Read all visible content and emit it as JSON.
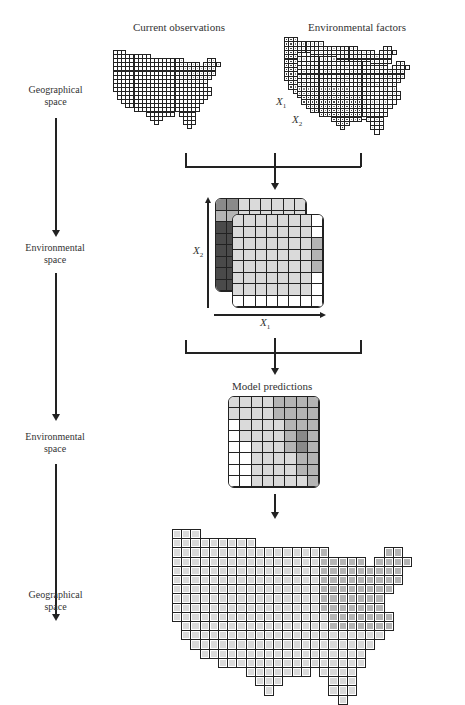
{
  "left_labels": [
    {
      "line1": "Geographical",
      "line2": "space"
    },
    {
      "line1": "Environmental",
      "line2": "space"
    },
    {
      "line1": "Environmental",
      "line2": "space"
    },
    {
      "line1": "Geographical",
      "line2": "space"
    }
  ],
  "titles": {
    "current_observations": "Current observations",
    "environmental_factors": "Environmental factors",
    "model_predictions": "Model predictions"
  },
  "variables": {
    "x1": "X",
    "x1_sub": "1",
    "x2": "X",
    "x2_sub": "2"
  },
  "colors": {
    "line": "#222222",
    "cell_white": "#ffffff",
    "shade_light": "#d9d9d9",
    "shade_mid": "#a8a8a8",
    "shade_dark": "#555555",
    "shade_darkest": "#2a2a2a"
  },
  "us_mask": [
    "111.......................",
    "111111111.................",
    "11111111111111111......11.",
    "111111111111111111111.1111",
    "1111111111111111111111111.",
    "1111111111111111111111111.",
    "111111111111111111111111..",
    "11111111111111111111111...",
    "11111111111111111111111...",
    "111111111111111111111111..",
    ".11111111111111111111111..",
    ".1111111111111111111111...",
    "..11111111111111111111....",
    "...111111111111111111.....",
    ".....1111111111111111.....",
    "........1111111.1111......",
    ".........111.....111......",
    "..........1......111......",
    "..................1......."
  ],
  "observations_shading": "northeast_light",
  "predictions_shading": "northeast_mid",
  "env_space": {
    "back_grid": [
      [
        3,
        3,
        1,
        1,
        1,
        1,
        1,
        1
      ],
      [
        2,
        2,
        1,
        1,
        1,
        1,
        1,
        1
      ],
      [
        4,
        4,
        1,
        1,
        1,
        1,
        1,
        1
      ],
      [
        4,
        4,
        1,
        1,
        1,
        1,
        1,
        1
      ],
      [
        4,
        4,
        1,
        1,
        1,
        1,
        1,
        1
      ],
      [
        4,
        4,
        1,
        1,
        1,
        1,
        1,
        1
      ],
      [
        4,
        4,
        1,
        1,
        1,
        1,
        1,
        1
      ],
      [
        4,
        4,
        1,
        1,
        1,
        1,
        1,
        1
      ]
    ],
    "front_grid": [
      [
        1,
        1,
        1,
        1,
        1,
        1,
        1,
        0
      ],
      [
        1,
        1,
        1,
        1,
        1,
        1,
        1,
        0
      ],
      [
        1,
        1,
        1,
        1,
        1,
        1,
        1,
        2
      ],
      [
        1,
        1,
        1,
        1,
        1,
        1,
        1,
        2
      ],
      [
        1,
        1,
        1,
        1,
        1,
        1,
        1,
        2
      ],
      [
        1,
        1,
        1,
        1,
        1,
        1,
        1,
        0
      ],
      [
        1,
        1,
        1,
        1,
        1,
        1,
        1,
        0
      ],
      [
        0,
        0,
        0,
        0,
        0,
        0,
        0,
        0
      ]
    ]
  },
  "predictions_grid": [
    [
      1,
      1,
      1,
      1,
      2,
      2,
      2,
      2
    ],
    [
      1,
      1,
      1,
      1,
      2,
      2,
      2,
      2
    ],
    [
      0,
      1,
      1,
      1,
      1,
      2,
      2,
      2
    ],
    [
      0,
      1,
      1,
      1,
      1,
      2,
      3,
      2
    ],
    [
      0,
      0,
      1,
      1,
      1,
      2,
      3,
      2
    ],
    [
      0,
      0,
      1,
      1,
      1,
      1,
      2,
      2
    ],
    [
      0,
      0,
      1,
      1,
      1,
      1,
      2,
      2
    ],
    [
      0,
      0,
      1,
      1,
      1,
      1,
      1,
      2
    ]
  ]
}
